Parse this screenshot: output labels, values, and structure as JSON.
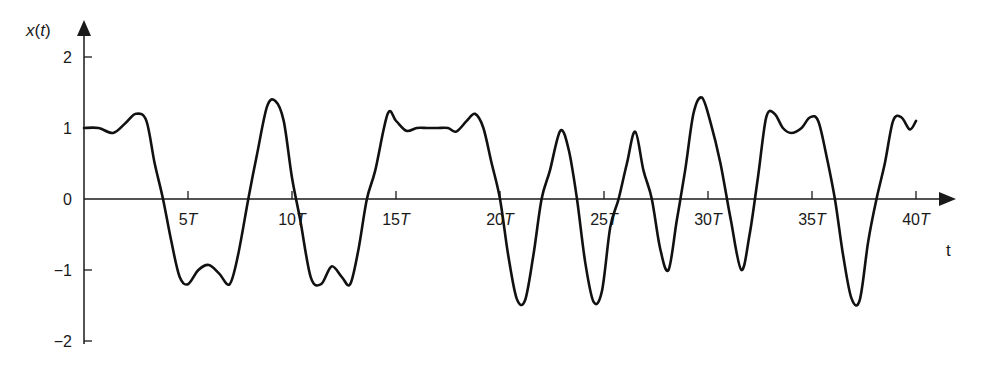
{
  "chart_data": {
    "type": "line",
    "title": "",
    "xlabel": "t",
    "ylabel": "x(t)",
    "xlim": [
      0,
      41.5
    ],
    "ylim": [
      -2,
      2
    ],
    "grid": false,
    "legend": null,
    "x_ticks": [
      {
        "value": 5,
        "label": "5T"
      },
      {
        "value": 10,
        "label": "10T"
      },
      {
        "value": 15,
        "label": "15T"
      },
      {
        "value": 20,
        "label": "20T"
      },
      {
        "value": 25,
        "label": "25T"
      },
      {
        "value": 30,
        "label": "30T"
      },
      {
        "value": 35,
        "label": "35T"
      },
      {
        "value": 40,
        "label": "40T"
      }
    ],
    "y_ticks": [
      {
        "value": 2,
        "label": "2"
      },
      {
        "value": 1,
        "label": "1"
      },
      {
        "value": 0,
        "label": "0"
      },
      {
        "value": -1,
        "label": "-1"
      },
      {
        "value": -2,
        "label": "-2"
      }
    ],
    "series": [
      {
        "name": "x(t)",
        "color": "#111111",
        "x": [
          0,
          0.7,
          1.4,
          2.0,
          2.5,
          3.0,
          3.4,
          3.8,
          4.2,
          4.6,
          5.0,
          5.5,
          6.0,
          6.5,
          7.0,
          7.4,
          7.9,
          8.3,
          8.8,
          9.2,
          9.6,
          10.0,
          10.4,
          10.9,
          11.4,
          11.9,
          12.4,
          12.8,
          13.2,
          13.6,
          14.0,
          14.6,
          15.0,
          15.5,
          16.0,
          16.5,
          17.0,
          17.5,
          17.9,
          18.4,
          18.8,
          19.2,
          19.6,
          20.0,
          20.4,
          20.8,
          21.2,
          21.6,
          22.0,
          22.4,
          22.9,
          23.3,
          23.7,
          24.1,
          24.5,
          24.9,
          25.3,
          25.7,
          26.1,
          26.5,
          26.9,
          27.3,
          27.7,
          28.1,
          28.5,
          28.9,
          29.3,
          29.7,
          30.1,
          30.6,
          31.1,
          31.6,
          32.0,
          32.4,
          32.8,
          33.2,
          33.6,
          34.0,
          34.5,
          34.9,
          35.3,
          35.7,
          36.1,
          36.5,
          36.9,
          37.3,
          37.7,
          38.1,
          38.5,
          38.9,
          39.3,
          39.7,
          40.0
        ],
        "y": [
          1.0,
          1.0,
          0.93,
          1.07,
          1.2,
          1.1,
          0.5,
          0.0,
          -0.6,
          -1.1,
          -1.2,
          -1.0,
          -0.93,
          -1.05,
          -1.2,
          -0.8,
          0.0,
          0.6,
          1.3,
          1.38,
          1.1,
          0.3,
          -0.3,
          -1.1,
          -1.2,
          -0.95,
          -1.1,
          -1.2,
          -0.7,
          0.0,
          0.4,
          1.2,
          1.1,
          0.96,
          1.0,
          1.0,
          1.0,
          1.0,
          0.95,
          1.1,
          1.2,
          1.0,
          0.5,
          0.0,
          -0.8,
          -1.4,
          -1.43,
          -0.8,
          0.0,
          0.4,
          0.96,
          0.7,
          0.0,
          -0.9,
          -1.45,
          -1.3,
          -0.4,
          0.0,
          0.5,
          0.95,
          0.4,
          0.0,
          -0.7,
          -1.0,
          -0.3,
          0.4,
          1.2,
          1.43,
          1.1,
          0.5,
          -0.3,
          -1.0,
          -0.5,
          0.3,
          1.15,
          1.2,
          1.0,
          0.93,
          1.0,
          1.15,
          1.1,
          0.6,
          0.0,
          -0.8,
          -1.4,
          -1.42,
          -0.6,
          0.0,
          0.5,
          1.1,
          1.15,
          0.98,
          1.1
        ]
      }
    ]
  },
  "axes": {
    "y_label_prefix": "x(",
    "y_label_var": "t",
    "y_label_suffix": ")",
    "x_label": "t",
    "tick_T": "T"
  }
}
